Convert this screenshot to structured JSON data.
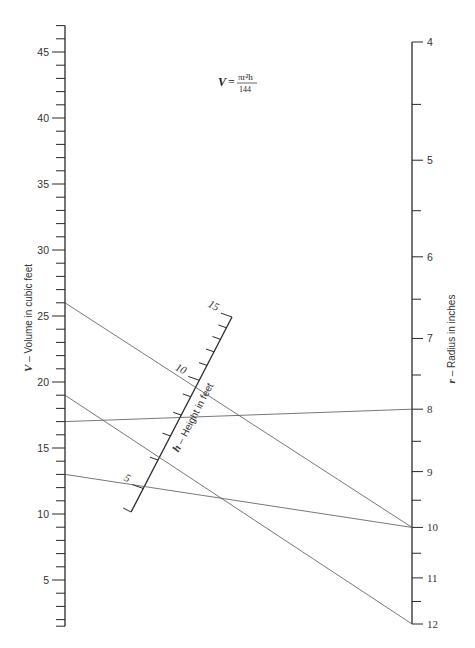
{
  "chart_data": {
    "type": "nomogram",
    "formula": {
      "lhs": "V",
      "equals": "=",
      "numerator": "πr²h",
      "denominator": "144"
    },
    "scales": {
      "V": {
        "label_var": "V",
        "label_text": " – Volume in cubic feet",
        "position": "left",
        "type": "linear",
        "range": [
          1.5,
          47
        ],
        "major_ticks": [
          5,
          10,
          15,
          20,
          25,
          30,
          35,
          40,
          45
        ],
        "minor_step": 1
      },
      "h": {
        "label_var": "h",
        "label_text": " – Height in feet",
        "position": "middle (slanted)",
        "type": "log",
        "range": [
          4.3,
          15
        ],
        "major_ticks": [
          5,
          10,
          15
        ],
        "minor_step": 1
      },
      "r": {
        "label_var": "r",
        "label_text": " – Radius in inches",
        "position": "right",
        "type": "log-square",
        "range": [
          4,
          12
        ],
        "major_ticks": [
          4,
          5,
          6,
          7,
          8,
          9,
          10,
          11,
          12
        ],
        "minor_step": 0.5
      }
    },
    "example_lines": [
      {
        "V": 26,
        "h": 12,
        "r": 10
      },
      {
        "V": 19,
        "h": 6,
        "r": 12
      },
      {
        "V": 17,
        "h": 12,
        "r": 8
      },
      {
        "V": 13,
        "h": 6,
        "r": 10
      }
    ]
  },
  "labels": {
    "V_var": "V",
    "V_text": " – Volume in cubic feet",
    "h_var": "h",
    "h_text": " – Height in feet",
    "r_var": "r",
    "r_text": " – Radius in inches",
    "formula_lhs": "V =",
    "formula_num": "πr²h",
    "formula_den": "144"
  },
  "colors": {
    "axis": "#2a2a2a",
    "lines": "#555555",
    "text": "#333333",
    "background": "#ffffff"
  }
}
